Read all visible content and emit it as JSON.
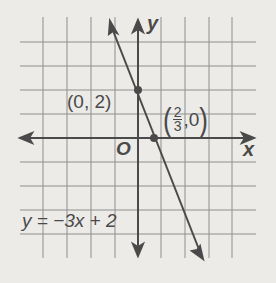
{
  "diagram": {
    "type": "coordinate-graph",
    "axes": {
      "x_label": "x",
      "y_label": "y",
      "origin_label": "O"
    },
    "grid": {
      "x_range": [
        -5,
        4
      ],
      "y_range": [
        -5,
        4
      ],
      "step": 1
    },
    "line": {
      "equation": "y = −3x + 2",
      "slope": -3,
      "intercept": 2
    },
    "points": [
      {
        "label": "(0, 2)",
        "x": 0,
        "y": 2
      },
      {
        "label_num": "2",
        "label_den": "3",
        "label_rest": ",0",
        "x": 0.6667,
        "y": 0
      }
    ],
    "colors": {
      "grid": "#8a8a8a",
      "axis": "#4a4a4a",
      "line": "#4a4a4a",
      "background": "#ecebe8"
    }
  }
}
